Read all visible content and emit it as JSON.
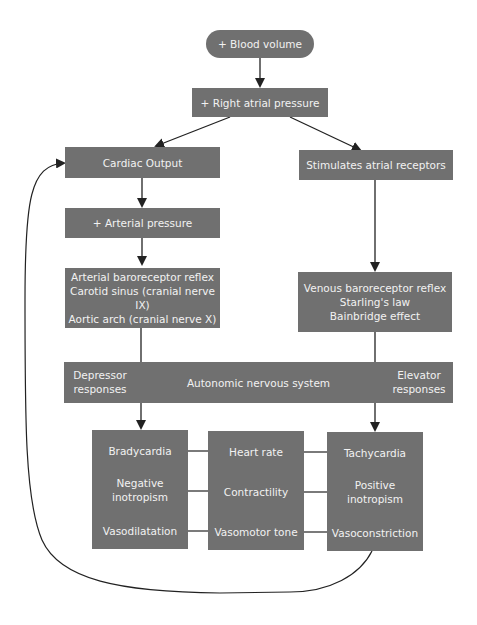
{
  "diagram": {
    "title_node": "+ Blood volume",
    "nodes": {
      "right_atrial": "+ Right atrial pressure",
      "cardiac_output": "Cardiac Output",
      "stimulates": "Stimulates atrial receptors",
      "arterial_pressure": "+ Arterial pressure",
      "arterial_reflex": [
        "Arterial baroreceptor reflex",
        "Carotid sinus (cranial nerve IX)",
        "Aortic arch (cranial nerve X)"
      ],
      "venous_reflex": [
        "Venous baroreceptor reflex",
        "Starling's law",
        "Bainbridge effect"
      ]
    },
    "ans_bar": {
      "left": [
        "Depressor",
        "responses"
      ],
      "center": "Autonomic nervous system",
      "right": [
        "Elevator",
        "responses"
      ]
    },
    "depressor_box": {
      "rows": [
        [
          "Bradycardia"
        ],
        [
          "Negative",
          "inotropism"
        ],
        [
          "Vasodilatation"
        ]
      ]
    },
    "parameter_box": {
      "rows": [
        [
          "Heart rate"
        ],
        [
          "Contractility"
        ],
        [
          "Vasomotor tone"
        ]
      ]
    },
    "elevator_box": {
      "rows": [
        [
          "Tachycardia"
        ],
        [
          "Positive",
          "inotropism"
        ],
        [
          "Vasoconstriction"
        ]
      ]
    },
    "colors": {
      "box_fill": "#707070",
      "box_text": "#f2f2f2",
      "line": "#222222"
    }
  }
}
